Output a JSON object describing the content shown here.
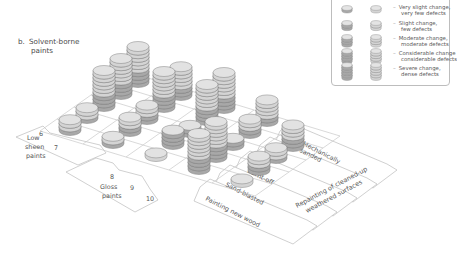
{
  "title": {
    "letter": "b.",
    "line1": "Solvent-borne",
    "line2": "paints"
  },
  "legend": {
    "items": [
      {
        "level": 1,
        "coins": 1,
        "line1": "Very slight change,",
        "line2": "very few defects"
      },
      {
        "level": 2,
        "coins": 2,
        "line1": "Slight change,",
        "line2": "few defects"
      },
      {
        "level": 3,
        "coins": 3,
        "line1": "Moderate change,",
        "line2": "moderate defects"
      },
      {
        "level": 4,
        "coins": 4,
        "line1": "Considerable change",
        "line2": "considerable defects"
      },
      {
        "level": 5,
        "coins": 5,
        "line1": "Severe change,",
        "line2": "dense defects"
      }
    ],
    "columns": [
      "darker",
      "lighter"
    ]
  },
  "paint_groups": [
    {
      "label_lines": [
        "Low",
        "sheen",
        "paints"
      ],
      "numbers": [
        "6",
        "7"
      ]
    },
    {
      "label_lines": [
        "Gloss",
        "paints"
      ],
      "numbers": [
        "8",
        "9",
        "10"
      ]
    }
  ],
  "treatments": [
    "Painting new wood",
    "Sand-blasted",
    "Burnt-off",
    "Mechanically sanded"
  ],
  "treatment_extra": [
    "Repainting of cleaned-up",
    "weathered surfaces"
  ],
  "colors": {
    "coin_dark": "#a8a8a8",
    "coin_light": "#d4d4d4",
    "coin_top": "#e2e2e2",
    "grid_line": "#c8c8c8",
    "text": "#555555"
  },
  "chart_data": {
    "type": "heatmap",
    "rows": [
      "6",
      "7",
      "8",
      "9",
      "10"
    ],
    "row_groups": {
      "Low sheen paints": [
        "6",
        "7"
      ],
      "Gloss paints": [
        "8",
        "9",
        "10"
      ]
    },
    "columns": [
      "Painting new wood",
      "Sand-blasted",
      "Burnt-off",
      "Mechanically sanded",
      "Repainting of cleaned-up weathered surfaces"
    ],
    "cells": [
      {
        "row": "6",
        "col": 0,
        "coins": 3,
        "dark": 1
      },
      {
        "row": "6",
        "col": 1,
        "coins": 3,
        "dark": 1
      },
      {
        "row": "6",
        "col": 2,
        "coins": 10,
        "dark": 4
      },
      {
        "row": "6",
        "col": 3,
        "coins": 10,
        "dark": 4
      },
      {
        "row": "6",
        "col": 4,
        "coins": 10,
        "dark": 4
      },
      {
        "row": "7",
        "col": 0,
        "coins": 2,
        "dark": 1
      },
      {
        "row": "7",
        "col": 1,
        "coins": 4,
        "dark": 2
      },
      {
        "row": "7",
        "col": 2,
        "coins": 4,
        "dark": 2
      },
      {
        "row": "7",
        "col": 3,
        "coins": 10,
        "dark": 4
      },
      {
        "row": "7",
        "col": 4,
        "coins": 8,
        "dark": 3
      },
      {
        "row": "8",
        "col": 0,
        "coins": 1,
        "dark": 0
      },
      {
        "row": "8",
        "col": 1,
        "coins": 4,
        "dark": 4
      },
      {
        "row": "8",
        "col": 2,
        "coins": 2,
        "dark": 2
      },
      {
        "row": "8",
        "col": 3,
        "coins": 10,
        "dark": 4
      },
      {
        "row": "8",
        "col": 4,
        "coins": 10,
        "dark": 4
      },
      {
        "row": "9",
        "col": 0,
        "coins": 10,
        "dark": 4
      },
      {
        "row": "9",
        "col": 1,
        "coins": 10,
        "dark": 4
      },
      {
        "row": "9",
        "col": 2,
        "coins": 2,
        "dark": 2
      },
      {
        "row": "9",
        "col": 3,
        "coins": 4,
        "dark": 2
      },
      {
        "row": "9",
        "col": 4,
        "coins": 6,
        "dark": 2
      },
      {
        "row": "10",
        "col": 0,
        "coins": 1,
        "dark": 0
      },
      {
        "row": "10",
        "col": 1,
        "coins": 4,
        "dark": 2
      },
      {
        "row": "10",
        "col": 2,
        "coins": 3,
        "dark": 1
      },
      {
        "row": "10",
        "col": 3,
        "coins": 6,
        "dark": 3
      },
      {
        "row": "10",
        "col": 4,
        "coins": 0,
        "dark": 0
      }
    ],
    "legend": [
      "Very slight change, very few defects",
      "Slight change, few defects",
      "Moderate change, moderate defects",
      "Considerable change considerable defects",
      "Severe change, dense defects"
    ]
  }
}
